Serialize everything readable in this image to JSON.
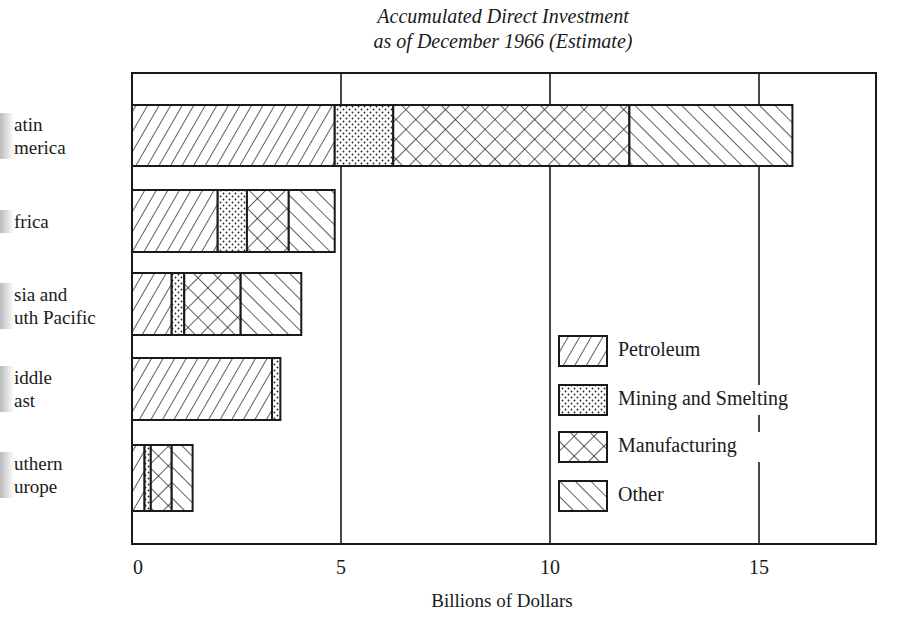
{
  "chart_data": {
    "type": "bar",
    "orientation": "horizontal",
    "stacked": true,
    "title": "Accumulated Direct Investment",
    "subtitle": "as of December 1966 (Estimate)",
    "xlabel": "Billions of Dollars",
    "ylabel": "",
    "xlim": [
      0,
      17.8
    ],
    "xticks": [
      "0",
      "5",
      "10",
      "15"
    ],
    "grid": "vertical at 5, 10, 15",
    "legend_position": "lower right inside",
    "categories": [
      "Latin America",
      "Africa",
      "Asia and South Pacific",
      "Middle East",
      "Southern Europe"
    ],
    "category_labels_visible": [
      "atin\nmerica",
      "frica",
      "sia and\nuth Pacific",
      "iddle\nast",
      "uthern\nurope"
    ],
    "series": [
      {
        "name": "Petroleum",
        "pattern": "diagonal-forward",
        "values": [
          4.85,
          2.05,
          0.95,
          3.35,
          0.3
        ]
      },
      {
        "name": "Mining and Smelting",
        "pattern": "dots",
        "values": [
          1.4,
          0.7,
          0.3,
          0.2,
          0.15
        ]
      },
      {
        "name": "Manufacturing",
        "pattern": "crosshatch",
        "values": [
          5.65,
          1.0,
          1.35,
          0,
          0.5
        ]
      },
      {
        "name": "Other",
        "pattern": "diagonal-back",
        "values": [
          3.9,
          1.1,
          1.45,
          0,
          0.5
        ]
      }
    ]
  },
  "labels": {
    "title1": "Accumulated Direct Investment",
    "title2": "as of December 1966 (Estimate)",
    "xlabel": "Billions of Dollars",
    "ticks": [
      "0",
      "5",
      "10",
      "15"
    ],
    "rows": [
      {
        "l1": "atin",
        "l2": "merica"
      },
      {
        "l1": "frica",
        "l2": ""
      },
      {
        "l1": "sia and",
        "l2": "uth Pacific"
      },
      {
        "l1": "iddle",
        "l2": "ast"
      },
      {
        "l1": "uthern",
        "l2": "urope"
      }
    ],
    "legend": [
      "Petroleum",
      "Mining and Smelting",
      "Manufacturing",
      "Other"
    ]
  }
}
